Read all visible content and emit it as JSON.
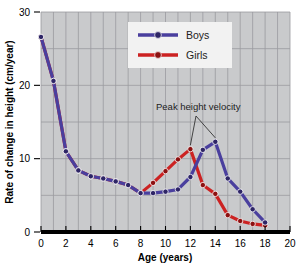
{
  "chart_data": {
    "type": "line",
    "title": "",
    "xlabel": "Age (years)",
    "ylabel": "Rate of change in height (cm/year)",
    "xlim": [
      0,
      20
    ],
    "ylim": [
      0,
      30
    ],
    "xticks": [
      0,
      2,
      4,
      6,
      8,
      10,
      12,
      14,
      16,
      18,
      20
    ],
    "yticks": [
      0,
      10,
      20,
      30
    ],
    "xtick_labels": [
      "0",
      "2",
      "4",
      "6",
      "8",
      "10",
      "12",
      "14",
      "16",
      "18",
      "20"
    ],
    "ytick_labels": [
      "0",
      "10",
      "20",
      "30"
    ],
    "grid": true,
    "grid_x_step": 1,
    "grid_y_step": 5,
    "legend_position": "top-center",
    "x": [
      0,
      1,
      2,
      3,
      4,
      5,
      6,
      7,
      8,
      9,
      10,
      11,
      12,
      13,
      14,
      15,
      16,
      17,
      18
    ],
    "series": [
      {
        "name": "Boys",
        "color": "#4a3f9e",
        "marker_color": "#2e2566",
        "values": [
          26.6,
          20.6,
          11.0,
          8.4,
          7.6,
          7.3,
          6.9,
          6.4,
          5.3,
          5.3,
          5.5,
          5.8,
          7.5,
          11.2,
          12.3,
          7.3,
          5.5,
          3.1,
          1.3
        ]
      },
      {
        "name": "Girls",
        "color": "#cc2222",
        "marker_color": "#8c1111",
        "values": [
          26.6,
          20.6,
          11.0,
          8.4,
          7.6,
          7.3,
          6.9,
          6.4,
          5.3,
          6.7,
          8.3,
          9.9,
          11.3,
          6.4,
          5.2,
          2.3,
          1.5,
          1.1,
          0.9
        ]
      }
    ],
    "annotations": [
      {
        "text": "Peak height velocity",
        "points_to": [
          [
            12,
            11.3
          ],
          [
            14,
            12.3
          ]
        ]
      }
    ],
    "legend_entries": [
      {
        "label": "Boys",
        "color": "#4a3f9e",
        "marker_color": "#2e2566"
      },
      {
        "label": "Girls",
        "color": "#cc2222",
        "marker_color": "#8c1111"
      }
    ],
    "colors": {
      "plot_background": "#c9cacc",
      "grid": "#9a9b9f",
      "axis": "#000000",
      "legend_background": "#f2f2f2"
    }
  }
}
